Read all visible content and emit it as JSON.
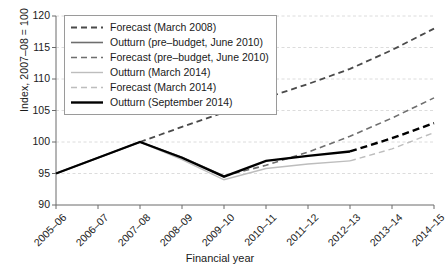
{
  "chart_data": {
    "type": "line",
    "title": "",
    "xlabel": "Financial year",
    "ylabel": "Index, 2007–08 = 100",
    "categories": [
      "2005–06",
      "2006–07",
      "2007–08",
      "2008–09",
      "2009–10",
      "2010–11",
      "2011–12",
      "2012–13",
      "2013–14",
      "2014–15"
    ],
    "ylim": [
      90,
      120
    ],
    "yticks": [
      90,
      95,
      100,
      105,
      110,
      115,
      120
    ],
    "grid": true,
    "legend_position": "top-left",
    "series": [
      {
        "name": "Forecast (March 2008)",
        "style": "dashed",
        "color": "#4a4a4a",
        "width": 1.8,
        "x": [
          "2007–08",
          "2008–09",
          "2009–10",
          "2010–11",
          "2011–12",
          "2012–13",
          "2013–14",
          "2014–15"
        ],
        "values": [
          100.0,
          102.4,
          104.7,
          107.0,
          109.2,
          111.6,
          114.6,
          118.0
        ]
      },
      {
        "name": "Outturn (pre–budget, June 2010)",
        "style": "solid",
        "color": "#6e6e6e",
        "width": 1.6,
        "x": [
          "2005–06",
          "2006–07",
          "2007–08",
          "2008–09",
          "2009–10"
        ],
        "values": [
          95.0,
          97.5,
          100.0,
          97.6,
          94.6
        ]
      },
      {
        "name": "Forecast (pre–budget, June 2010)",
        "style": "dashed",
        "color": "#6e6e6e",
        "width": 1.6,
        "x": [
          "2009–10",
          "2010–11",
          "2011–12",
          "2012–13",
          "2013–14",
          "2014–15"
        ],
        "values": [
          94.6,
          96.3,
          98.4,
          100.9,
          103.8,
          107.0
        ]
      },
      {
        "name": "Outturn (March 2014)",
        "style": "solid",
        "color": "#bdbdbd",
        "width": 1.4,
        "x": [
          "2005–06",
          "2006–07",
          "2007–08",
          "2008–09",
          "2009–10",
          "2010–11",
          "2011–12",
          "2012–13"
        ],
        "values": [
          95.0,
          97.5,
          100.0,
          97.2,
          94.0,
          95.8,
          96.5,
          97.0
        ]
      },
      {
        "name": "Forecast (March 2014)",
        "style": "dashed",
        "color": "#bdbdbd",
        "width": 1.4,
        "x": [
          "2012–13",
          "2013–14",
          "2014–15"
        ],
        "values": [
          97.0,
          98.9,
          101.5
        ]
      },
      {
        "name": "Outturn (September 2014)",
        "style": "solid",
        "color": "#000000",
        "width": 2.4,
        "x": [
          "2005–06",
          "2006–07",
          "2007–08",
          "2008–09",
          "2009–10",
          "2010–11",
          "2011–12",
          "2012–13"
        ],
        "values": [
          95.0,
          97.5,
          100.0,
          97.5,
          94.5,
          97.0,
          97.8,
          98.5
        ]
      },
      {
        "name": "Forecast (September 2014)",
        "style": "dashed",
        "color": "#000000",
        "width": 2.4,
        "x": [
          "2012–13",
          "2013–14",
          "2014–15"
        ],
        "values": [
          98.5,
          100.6,
          103.0
        ]
      }
    ],
    "legend_entries": [
      {
        "label": "Forecast (March 2008)",
        "style": "dashed",
        "color": "#4a4a4a",
        "width": 1.8
      },
      {
        "label": "Outturn (pre–budget, June 2010)",
        "style": "solid",
        "color": "#6e6e6e",
        "width": 1.6
      },
      {
        "label": "Forecast (pre–budget, June 2010)",
        "style": "dashed",
        "color": "#6e6e6e",
        "width": 1.6
      },
      {
        "label": "Outturn (March 2014)",
        "style": "solid",
        "color": "#bdbdbd",
        "width": 1.4
      },
      {
        "label": "Forecast (March 2014)",
        "style": "dashed",
        "color": "#bdbdbd",
        "width": 1.4
      },
      {
        "label": "Outturn (September 2014)",
        "style": "solid",
        "color": "#000000",
        "width": 2.4
      }
    ]
  },
  "axes": {
    "grid_color": "#d8d8d8",
    "axis_color": "#6a6a6a"
  }
}
